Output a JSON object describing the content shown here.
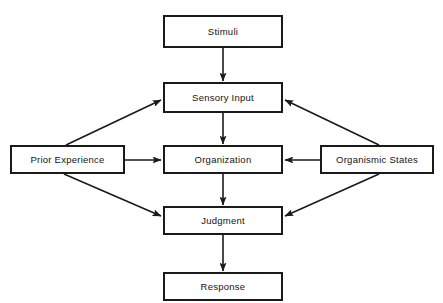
{
  "diagram": {
    "style": {
      "stroke_color": "#1a1a1a",
      "background_color": "#ffffff",
      "text_color": "#141414"
    },
    "nodes": [
      {
        "id": "stimuli",
        "label": "Stimuli",
        "x": 163,
        "y": 15,
        "w": 120,
        "h": 33
      },
      {
        "id": "sensory_input",
        "label": "Sensory Input",
        "x": 163,
        "y": 82,
        "w": 120,
        "h": 31
      },
      {
        "id": "prior_experience",
        "label": "Prior Experience",
        "x": 10,
        "y": 145,
        "w": 115,
        "h": 29
      },
      {
        "id": "organization",
        "label": "Organization",
        "x": 163,
        "y": 145,
        "w": 120,
        "h": 29
      },
      {
        "id": "organismic_states",
        "label": "Organismic States",
        "x": 320,
        "y": 145,
        "w": 114,
        "h": 29
      },
      {
        "id": "judgment",
        "label": "Judgment",
        "x": 163,
        "y": 206,
        "w": 120,
        "h": 29
      },
      {
        "id": "response",
        "label": "Response",
        "x": 163,
        "y": 272,
        "w": 120,
        "h": 29
      }
    ],
    "edges": [
      {
        "id": "stimuli-to-sensory",
        "from": "stimuli",
        "to": "sensory_input",
        "kind": "vertical"
      },
      {
        "id": "sensory-to-organization",
        "from": "sensory_input",
        "to": "organization",
        "kind": "vertical"
      },
      {
        "id": "organization-to-judgment",
        "from": "organization",
        "to": "judgment",
        "kind": "vertical"
      },
      {
        "id": "judgment-to-response",
        "from": "judgment",
        "to": "response",
        "kind": "vertical"
      },
      {
        "id": "prior-to-sensory",
        "from": "prior_experience",
        "to": "sensory_input",
        "kind": "diagonal"
      },
      {
        "id": "prior-to-organization",
        "from": "prior_experience",
        "to": "organization",
        "kind": "horizontal"
      },
      {
        "id": "prior-to-judgment",
        "from": "prior_experience",
        "to": "judgment",
        "kind": "diagonal"
      },
      {
        "id": "organismic-to-sensory",
        "from": "organismic_states",
        "to": "sensory_input",
        "kind": "diagonal"
      },
      {
        "id": "organismic-to-organization",
        "from": "organismic_states",
        "to": "organization",
        "kind": "horizontal"
      },
      {
        "id": "organismic-to-judgment",
        "from": "organismic_states",
        "to": "judgment",
        "kind": "diagonal"
      }
    ]
  }
}
